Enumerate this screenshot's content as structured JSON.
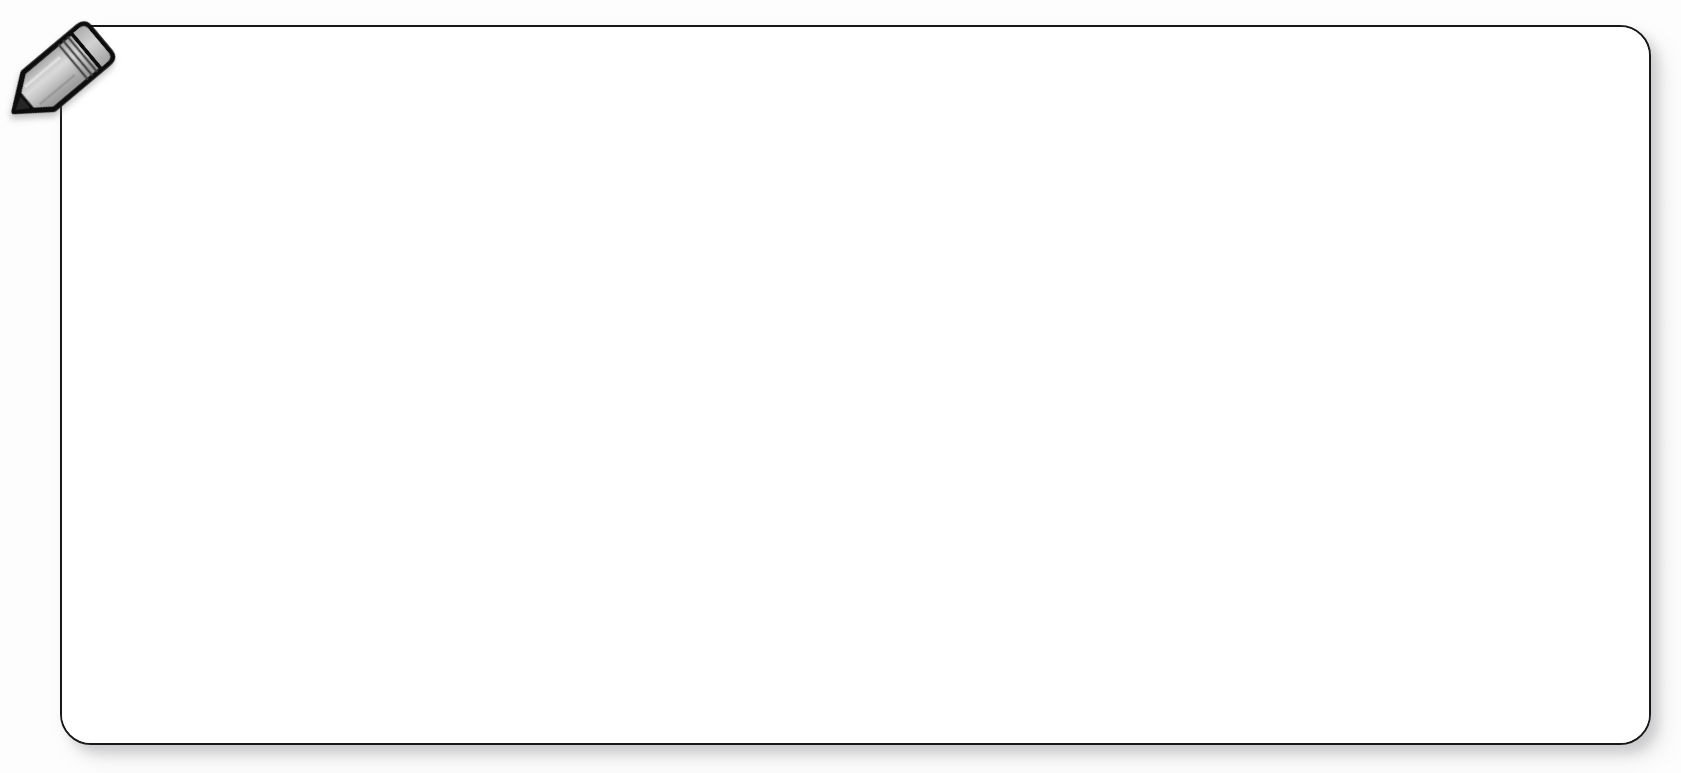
{
  "canvas": {
    "width": 1681,
    "height": 773,
    "background_color": "#fdfdfd"
  },
  "note_panel": {
    "name": "note-canvas-panel",
    "state": "empty",
    "content_text": "",
    "placeholder": "",
    "fill_color": "#ffffff",
    "border_color": "#181818",
    "border_width_px": 2,
    "corner_radius_px": 31,
    "bounds": {
      "x": 60,
      "y": 25,
      "width": 1591,
      "height": 720
    },
    "shadow_color": "#5a5a5f"
  },
  "pencil_icon": {
    "name": "pencil-icon",
    "label": "",
    "body_color": "#b3b3b3",
    "body_highlight_color": "#d6d6d6",
    "body_shade_color": "#9a9a9a",
    "outline_color": "#111111",
    "tip_color": "#2a2a2a",
    "eraser_color": "#c6c6c6",
    "ferrule_band_count": 3,
    "rotation_deg": 50,
    "bounds": {
      "x": 2,
      "y": 14,
      "width": 110,
      "height": 125
    }
  }
}
